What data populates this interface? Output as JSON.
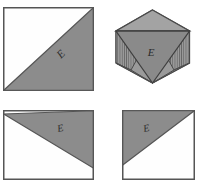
{
  "drawing": {
    "title": "Orthographic projection with isometric pictorial view",
    "background_color": "#ffffff",
    "outline_color": "#555555",
    "fill_gray": "#8c8c8c",
    "fill_gray_light": "#9a9a9a",
    "fill_gray_dark": "#7d7d7d",
    "fill_white": "#fefefe",
    "hatch_color": "#555555",
    "label_color": "#2b2b2b"
  },
  "views": [
    {
      "id": "front-view",
      "name": "front-view",
      "shape": "square",
      "position": {
        "x": 3,
        "y": 7,
        "width": 90,
        "height": 83
      },
      "diagonal": "bottom-left-to-top-right",
      "shaded_region": "lower-right-triangle",
      "label": "E",
      "label_rotation": -45,
      "label_position": {
        "x": 62,
        "y": 57
      }
    },
    {
      "id": "isometric-view",
      "name": "isometric-view",
      "shape": "hexagon-cube",
      "position": {
        "x": 113,
        "y": 8,
        "width": 78,
        "height": 76
      },
      "faces": [
        {
          "name": "top-face",
          "shading": "light-gray",
          "hatched": false
        },
        {
          "name": "left-face",
          "shading": "gray",
          "hatched": true
        },
        {
          "name": "right-face",
          "shading": "gray",
          "hatched": true
        },
        {
          "name": "vee-groove-face",
          "shading": "dark-gray",
          "hatched": false
        }
      ],
      "label": "E",
      "label_rotation": 0,
      "label_position": {
        "x": 155,
        "y": 52
      }
    },
    {
      "id": "top-view",
      "name": "top-view",
      "shape": "rectangle",
      "position": {
        "x": 3,
        "y": 110,
        "width": 90,
        "height": 69
      },
      "diagonal": "top-left-to-bottom-right",
      "shaded_region": "upper-right-triangle",
      "label": "E",
      "label_rotation": -12,
      "label_position": {
        "x": 58,
        "y": 130
      }
    },
    {
      "id": "side-view",
      "name": "side-view",
      "shape": "rectangle",
      "position": {
        "x": 122,
        "y": 110,
        "width": 72,
        "height": 69
      },
      "diagonal": "bottom-left-to-top-right",
      "shaded_region": "upper-left-triangle",
      "label": "E",
      "label_rotation": -12,
      "label_position": {
        "x": 146,
        "y": 130
      }
    }
  ],
  "labels": {
    "front": "E",
    "isometric": "E",
    "top": "E",
    "side": "E"
  }
}
